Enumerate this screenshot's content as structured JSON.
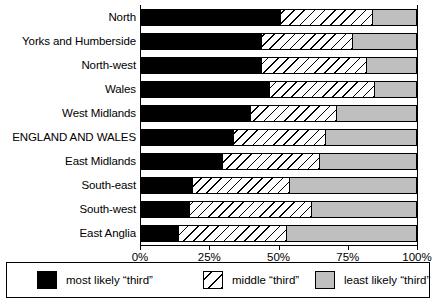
{
  "chart_data": {
    "type": "bar",
    "orientation": "horizontal",
    "stacked": true,
    "normalized": true,
    "title": "",
    "xlabel": "",
    "ylabel": "",
    "xlim": [
      0,
      100
    ],
    "grid": false,
    "legend_position": "bottom",
    "categories": [
      "North",
      "Yorks and Humberside",
      "North-west",
      "Wales",
      "West Midlands",
      "ENGLAND AND WALES",
      "East Midlands",
      "South-east",
      "South-west",
      "East Anglia"
    ],
    "tick_labels": [
      "0%",
      "25%",
      "50%",
      "75%",
      "100%"
    ],
    "tick_values": [
      0,
      25,
      50,
      75,
      100
    ],
    "series": [
      {
        "name": "most likely “third”",
        "fill": "solid-black",
        "color": "#000000",
        "values": [
          51,
          44,
          44,
          47,
          40,
          34,
          30,
          19,
          18,
          14
        ]
      },
      {
        "name": "middle “third”",
        "fill": "diagonal-hatch",
        "color": "#ffffff",
        "values": [
          33,
          33,
          38,
          38,
          31,
          33,
          35,
          35,
          44,
          39
        ]
      },
      {
        "name": "least likely “third”",
        "fill": "solid-gray",
        "color": "#bfbfbf",
        "values": [
          16,
          23,
          18,
          15,
          29,
          33,
          35,
          46,
          38,
          47
        ]
      }
    ],
    "cumulative_boundaries": [
      [
        51,
        84
      ],
      [
        44,
        77
      ],
      [
        44,
        82
      ],
      [
        47,
        85
      ],
      [
        40,
        71
      ],
      [
        34,
        67
      ],
      [
        30,
        65
      ],
      [
        19,
        54
      ],
      [
        18,
        62
      ],
      [
        14,
        53
      ]
    ]
  },
  "legend": {
    "entries": [
      {
        "label": "most likely “third”",
        "swatch": "solid-black"
      },
      {
        "label": "middle “third”",
        "swatch": "diagonal-hatch"
      },
      {
        "label": "least likely “third”",
        "swatch": "solid-gray"
      }
    ]
  }
}
